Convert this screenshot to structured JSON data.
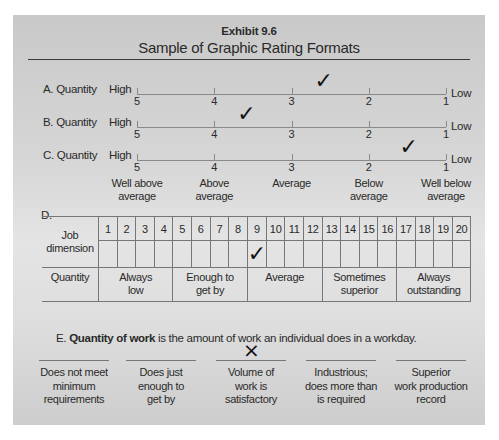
{
  "header": {
    "exhibit": "Exhibit 9.6",
    "title": "Sample of Graphic Rating Formats"
  },
  "scales": [
    {
      "label": "A. Quantity",
      "high": "High",
      "low": "Low",
      "points": [
        "5",
        "4",
        "3",
        "2",
        "1"
      ],
      "check_position": 2.6
    },
    {
      "label": "B. Quantity",
      "high": "High",
      "low": "Low",
      "points": [
        "5",
        "4",
        "3",
        "2",
        "1"
      ],
      "check_position": 3.6
    },
    {
      "label": "C. Quantity",
      "high": "High",
      "low": "Low",
      "points": [
        "5",
        "4",
        "3",
        "2",
        "1"
      ],
      "check_position": 1.5
    }
  ],
  "scale_c_anchors": [
    "Well above average",
    "Above average",
    "Average",
    "Below average",
    "Well below average"
  ],
  "scale_c_anchor_lines": [
    [
      "Well above",
      "average"
    ],
    [
      "Above",
      "average"
    ],
    [
      "Average",
      ""
    ],
    [
      "Below",
      "average"
    ],
    [
      "Well below",
      "average"
    ]
  ],
  "section_d": {
    "label": "D.",
    "row_header": [
      "Job",
      "dimension"
    ],
    "numbers": [
      "1",
      "2",
      "3",
      "4",
      "5",
      "6",
      "7",
      "8",
      "9",
      "10",
      "11",
      "12",
      "13",
      "14",
      "15",
      "16",
      "17",
      "18",
      "19",
      "20"
    ],
    "checked": "9",
    "dimension": "Quantity",
    "anchors": [
      {
        "text": [
          "Always",
          "low"
        ],
        "span": 4
      },
      {
        "text": [
          "Enough to",
          "get by"
        ],
        "span": 4
      },
      {
        "text": [
          "Average",
          ""
        ],
        "span": 4
      },
      {
        "text": [
          "Sometimes",
          "superior"
        ],
        "span": 4
      },
      {
        "text": [
          "Always",
          "outstanding"
        ],
        "span": 4
      }
    ]
  },
  "section_e": {
    "prefix": "E.",
    "bold": "Quantity of work",
    "rest": "is the amount of work an individual does in a workday.",
    "marked_index": 2,
    "mark": "×",
    "options": [
      [
        "Does not meet",
        "minimum",
        "requirements"
      ],
      [
        "Does just",
        "enough to",
        "get by"
      ],
      [
        "Volume of",
        "work is",
        "satisfactory"
      ],
      [
        "Industrious;",
        "does more than",
        "is required"
      ],
      [
        "Superior",
        "work production",
        "record"
      ]
    ]
  },
  "icons": {
    "check": "✓",
    "cross": "×"
  }
}
